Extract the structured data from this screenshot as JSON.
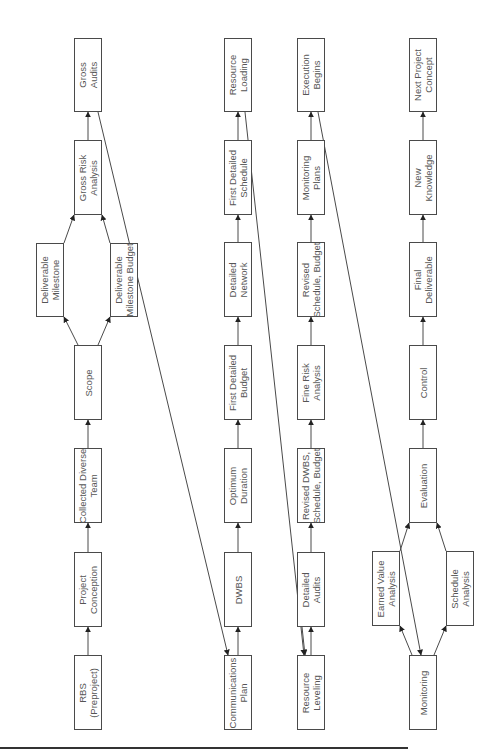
{
  "diagram": {
    "orientation": "rotated 90 degrees counter-clockwise; flow reads bottom to top within each column",
    "columns": [
      {
        "name": "conception-column",
        "nodes": [
          {
            "id": "rbs",
            "label": "RBS\n(Preproject)",
            "x": 74,
            "y": 655,
            "w": 28,
            "h": 75
          },
          {
            "id": "project-conception",
            "label": "Project\nConception",
            "x": 74,
            "y": 552,
            "w": 28,
            "h": 75
          },
          {
            "id": "collected-diverse-team",
            "label": "Collected Diverse\nTeam",
            "x": 74,
            "y": 448,
            "w": 28,
            "h": 75
          },
          {
            "id": "scope",
            "label": "Scope",
            "x": 74,
            "y": 345,
            "w": 28,
            "h": 75
          },
          {
            "id": "deliverable-milestone",
            "label": "Deliverable\nMilestone",
            "x": 36,
            "y": 243,
            "w": 28,
            "h": 74
          },
          {
            "id": "deliverable-milestone-budget",
            "label": "Deliverable\nMilestone Budget",
            "x": 110,
            "y": 243,
            "w": 28,
            "h": 74
          },
          {
            "id": "gross-risk-analysis",
            "label": "Gross Risk\nAnalysis",
            "x": 74,
            "y": 140,
            "w": 28,
            "h": 75
          },
          {
            "id": "gross-audits",
            "label": "Gross\nAudits",
            "x": 74,
            "y": 38,
            "w": 28,
            "h": 74
          }
        ]
      },
      {
        "name": "planning-column",
        "nodes": [
          {
            "id": "communications-plan",
            "label": "Communications\nPlan",
            "x": 224,
            "y": 655,
            "w": 28,
            "h": 75
          },
          {
            "id": "dwbs",
            "label": "DWBS",
            "x": 224,
            "y": 552,
            "w": 28,
            "h": 75
          },
          {
            "id": "optimum-duration",
            "label": "Optimum\nDuration",
            "x": 224,
            "y": 448,
            "w": 28,
            "h": 75
          },
          {
            "id": "first-detailed-budget",
            "label": "First Detailed\nBudget",
            "x": 224,
            "y": 345,
            "w": 28,
            "h": 75
          },
          {
            "id": "detailed-network",
            "label": "Detailed\nNetwork",
            "x": 224,
            "y": 242,
            "w": 28,
            "h": 75
          },
          {
            "id": "first-detailed-schedule",
            "label": "First Detailed\nSchedule",
            "x": 224,
            "y": 140,
            "w": 28,
            "h": 75
          },
          {
            "id": "resource-loading",
            "label": "Resource\nLoading",
            "x": 224,
            "y": 38,
            "w": 28,
            "h": 74
          }
        ]
      },
      {
        "name": "refinement-column",
        "nodes": [
          {
            "id": "resource-leveling",
            "label": "Resource\nLeveling",
            "x": 297,
            "y": 655,
            "w": 28,
            "h": 75
          },
          {
            "id": "detailed-audits",
            "label": "Detailed\nAudits",
            "x": 297,
            "y": 552,
            "w": 28,
            "h": 75
          },
          {
            "id": "revised-dwbs-schedule-budget",
            "label": "Revised DWBS,\nSchedule, Budget",
            "x": 297,
            "y": 448,
            "w": 28,
            "h": 75
          },
          {
            "id": "fine-risk-analysis",
            "label": "Fine Risk\nAnalysis",
            "x": 297,
            "y": 345,
            "w": 28,
            "h": 75
          },
          {
            "id": "revised-schedule-budget",
            "label": "Revised\nSchedule, Budget",
            "x": 297,
            "y": 242,
            "w": 28,
            "h": 75
          },
          {
            "id": "monitoring-plans",
            "label": "Monitoring\nPlans",
            "x": 297,
            "y": 140,
            "w": 28,
            "h": 75
          },
          {
            "id": "execution-begins",
            "label": "Execution\nBegins",
            "x": 297,
            "y": 38,
            "w": 28,
            "h": 74
          }
        ]
      },
      {
        "name": "execution-column",
        "nodes": [
          {
            "id": "monitoring",
            "label": "Monitoring",
            "x": 409,
            "y": 655,
            "w": 28,
            "h": 75
          },
          {
            "id": "earned-value-analysis",
            "label": "Earned Value\nAnalysis",
            "x": 372,
            "y": 551,
            "w": 28,
            "h": 75
          },
          {
            "id": "schedule-analysis",
            "label": "Schedule\nAnalysis",
            "x": 446,
            "y": 551,
            "w": 28,
            "h": 75
          },
          {
            "id": "evaluation",
            "label": "Evaluation",
            "x": 409,
            "y": 448,
            "w": 28,
            "h": 75
          },
          {
            "id": "control",
            "label": "Control",
            "x": 409,
            "y": 345,
            "w": 28,
            "h": 75
          },
          {
            "id": "final-deliverable",
            "label": "Final\nDeliverable",
            "x": 409,
            "y": 242,
            "w": 28,
            "h": 75
          },
          {
            "id": "new-knowledge",
            "label": "New\nKnowledge",
            "x": 409,
            "y": 140,
            "w": 28,
            "h": 75
          },
          {
            "id": "next-project-concept",
            "label": "Next Project\nConcept",
            "x": 409,
            "y": 38,
            "w": 28,
            "h": 74
          }
        ]
      }
    ],
    "edges": [
      {
        "from": "rbs",
        "to": "project-conception",
        "points": [
          [
            88,
            655
          ],
          [
            88,
            627
          ]
        ]
      },
      {
        "from": "project-conception",
        "to": "collected-diverse-team",
        "points": [
          [
            88,
            552
          ],
          [
            88,
            523
          ]
        ]
      },
      {
        "from": "collected-diverse-team",
        "to": "scope",
        "points": [
          [
            88,
            448
          ],
          [
            88,
            420
          ]
        ]
      },
      {
        "from": "scope",
        "to": "deliverable-milestone",
        "points": [
          [
            78,
            345
          ],
          [
            64,
            317
          ]
        ]
      },
      {
        "from": "scope",
        "to": "deliverable-milestone-budget",
        "points": [
          [
            98,
            345
          ],
          [
            110,
            317
          ]
        ]
      },
      {
        "from": "deliverable-milestone",
        "to": "gross-risk-analysis",
        "points": [
          [
            64,
            243
          ],
          [
            74,
            215
          ]
        ]
      },
      {
        "from": "deliverable-milestone-budget",
        "to": "gross-risk-analysis",
        "points": [
          [
            110,
            243
          ],
          [
            102,
            215
          ]
        ]
      },
      {
        "from": "gross-risk-analysis",
        "to": "gross-audits",
        "points": [
          [
            88,
            140
          ],
          [
            88,
            112
          ]
        ]
      },
      {
        "from": "gross-audits",
        "to": "communications-plan",
        "points": [
          [
            98,
            112
          ],
          [
            228,
            655
          ]
        ],
        "note": "long diagonal via milestone budget"
      },
      {
        "from": "communications-plan",
        "to": "dwbs",
        "points": [
          [
            238,
            655
          ],
          [
            238,
            627
          ]
        ]
      },
      {
        "from": "dwbs",
        "to": "optimum-duration",
        "points": [
          [
            238,
            552
          ],
          [
            238,
            523
          ]
        ]
      },
      {
        "from": "optimum-duration",
        "to": "first-detailed-budget",
        "points": [
          [
            238,
            448
          ],
          [
            238,
            420
          ]
        ]
      },
      {
        "from": "first-detailed-budget",
        "to": "detailed-network",
        "points": [
          [
            238,
            345
          ],
          [
            238,
            317
          ]
        ]
      },
      {
        "from": "detailed-network",
        "to": "first-detailed-schedule",
        "points": [
          [
            238,
            242
          ],
          [
            238,
            215
          ]
        ]
      },
      {
        "from": "first-detailed-schedule",
        "to": "resource-loading",
        "points": [
          [
            238,
            140
          ],
          [
            238,
            112
          ]
        ]
      },
      {
        "from": "resource-loading",
        "to": "resource-leveling",
        "points": [
          [
            245,
            112
          ],
          [
            304,
            655
          ]
        ],
        "note": "long diagonal"
      },
      {
        "from": "resource-leveling",
        "to": "detailed-audits",
        "points": [
          [
            311,
            655
          ],
          [
            311,
            627
          ]
        ]
      },
      {
        "from": "detailed-audits",
        "to": "resource-leveling",
        "points": [
          [
            302,
            627
          ],
          [
            305,
            655
          ]
        ],
        "note": "feedback arrow"
      },
      {
        "from": "detailed-audits",
        "to": "revised-dwbs-schedule-budget",
        "points": [
          [
            311,
            552
          ],
          [
            311,
            523
          ]
        ]
      },
      {
        "from": "revised-dwbs-schedule-budget",
        "to": "fine-risk-analysis",
        "points": [
          [
            311,
            448
          ],
          [
            311,
            420
          ]
        ]
      },
      {
        "from": "fine-risk-analysis",
        "to": "revised-schedule-budget",
        "points": [
          [
            311,
            345
          ],
          [
            311,
            317
          ]
        ]
      },
      {
        "from": "revised-schedule-budget",
        "to": "monitoring-plans",
        "points": [
          [
            311,
            242
          ],
          [
            311,
            215
          ]
        ]
      },
      {
        "from": "monitoring-plans",
        "to": "execution-begins",
        "points": [
          [
            311,
            140
          ],
          [
            311,
            112
          ]
        ]
      },
      {
        "from": "execution-begins",
        "to": "monitoring",
        "points": [
          [
            318,
            112
          ],
          [
            421,
            655
          ]
        ],
        "note": "long diagonal"
      },
      {
        "from": "monitoring",
        "to": "earned-value-analysis",
        "points": [
          [
            412,
            655
          ],
          [
            400,
            626
          ]
        ]
      },
      {
        "from": "monitoring",
        "to": "schedule-analysis",
        "points": [
          [
            434,
            655
          ],
          [
            446,
            626
          ]
        ]
      },
      {
        "from": "earned-value-analysis",
        "to": "evaluation",
        "points": [
          [
            400,
            551
          ],
          [
            409,
            523
          ]
        ]
      },
      {
        "from": "schedule-analysis",
        "to": "evaluation",
        "points": [
          [
            446,
            551
          ],
          [
            437,
            523
          ]
        ]
      },
      {
        "from": "evaluation",
        "to": "control",
        "points": [
          [
            423,
            448
          ],
          [
            423,
            420
          ]
        ]
      },
      {
        "from": "control",
        "to": "final-deliverable",
        "points": [
          [
            423,
            345
          ],
          [
            423,
            317
          ]
        ]
      },
      {
        "from": "final-deliverable",
        "to": "new-knowledge",
        "points": [
          [
            423,
            242
          ],
          [
            423,
            215
          ]
        ]
      },
      {
        "from": "new-knowledge",
        "to": "next-project-concept",
        "points": [
          [
            423,
            140
          ],
          [
            423,
            112
          ]
        ]
      }
    ],
    "colors": {
      "stroke": "#4a4a4a",
      "text": "#555555",
      "background": "#ffffff",
      "rule": "#333333"
    }
  }
}
